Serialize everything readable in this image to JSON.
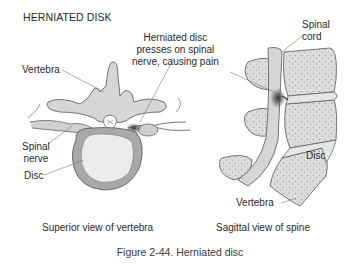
{
  "title": "HERNIATED DISK",
  "labels": {
    "callout": [
      "Herniated disc",
      "presses on spinal",
      "nerve, causing pain"
    ],
    "spinal_cord": [
      "Spinal",
      "cord"
    ],
    "vertebra_left": "Vertebra",
    "spinal_nerve": [
      "Spinal",
      "nerve"
    ],
    "disc_left": "Disc",
    "disc_right": "Disc",
    "vertebra_right": "Vertebra"
  },
  "captions": {
    "left": "Superior view of vertebra",
    "right": "Sagittal view of spine",
    "figure": "Figure 2-44. Herniated disc"
  },
  "colors": {
    "bone_fill": "#d6d6d6",
    "disc_outer": "#a8a8a8",
    "disc_inner": "#ececec",
    "outline": "#555555",
    "text": "#2a2a2a"
  }
}
